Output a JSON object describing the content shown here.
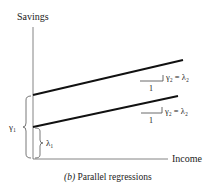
{
  "figure": {
    "caption_prefix": "(b)",
    "caption_text": " Parallel regressions",
    "y_axis_label": "Savings",
    "x_axis_label": "Income",
    "upper_line": {
      "slope_run_label": "1",
      "slope_label": "γ₂ = λ₂"
    },
    "lower_line": {
      "slope_run_label": "1",
      "slope_label": "γ₂ = λ₂"
    },
    "intercept_upper_label": "γ₁",
    "intercept_lower_label": "λ₁",
    "colors": {
      "line": "#111111",
      "axis": "#555555",
      "text": "#222222"
    }
  }
}
